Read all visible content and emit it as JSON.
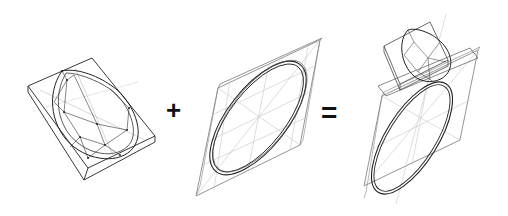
{
  "diagram": {
    "type": "equation",
    "operators": {
      "plus": "+",
      "equals": "="
    },
    "colors": {
      "stroke_dark": "#222222",
      "stroke_light": "#bdbdbd",
      "background": "#ffffff"
    },
    "panels": [
      {
        "id": "gem",
        "label": "pear-shaped gemstone in bounding box"
      },
      {
        "id": "band",
        "label": "ring band in bounding box"
      },
      {
        "id": "ring",
        "label": "assembled ring"
      }
    ]
  }
}
